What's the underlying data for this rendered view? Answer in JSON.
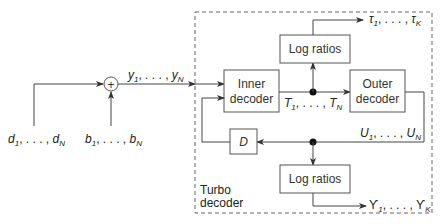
{
  "diagram": {
    "type": "turbo-decoder-block-diagram",
    "container": {
      "label_line1": "Turbo",
      "label_line2": "decoder"
    },
    "blocks": {
      "inner_decoder": {
        "line1": "Inner",
        "line2": "decoder"
      },
      "outer_decoder": {
        "line1": "Outer",
        "line2": "decoder"
      },
      "log_ratios_top": {
        "label": "Log ratios"
      },
      "log_ratios_bottom": {
        "label": "Log ratios"
      },
      "delay": {
        "label": "D"
      },
      "adder": {
        "symbol": "+"
      }
    },
    "signals": {
      "input_data": {
        "base": "d",
        "first": "1",
        "last": "N",
        "sep": ", . . . , "
      },
      "noise": {
        "base": "b",
        "first": "1",
        "last": "N",
        "sep": ", . . . , "
      },
      "received": {
        "base": "y",
        "first": "1",
        "last": "N",
        "sep": ", . . . , "
      },
      "inner_out": {
        "base": "T",
        "first": "1",
        "last": "N",
        "sep": ", . . . , "
      },
      "outer_out": {
        "base": "U",
        "first": "1",
        "last": "N",
        "sep": ", . . . , "
      },
      "tau_out": {
        "base": "τ",
        "first": "1",
        "last": "K",
        "sep": ", . . . , "
      },
      "upsilon_out": {
        "base": "ϒ",
        "first": "1",
        "last": "K",
        "sep": ", . . . , "
      }
    },
    "colors": {
      "line": "#444444",
      "box_border": "#555555",
      "text": "#222222",
      "background": "#ffffff"
    }
  }
}
